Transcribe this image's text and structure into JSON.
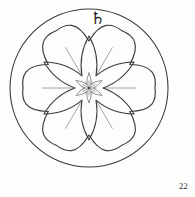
{
  "plate": {
    "planet_glyph": "♄",
    "planet_glyph_name": "saturn-glyph",
    "plate_number": "22",
    "ink_color": "#3a3a3c",
    "background_color": "#fdfdfc"
  },
  "figure": {
    "outer_circle": {
      "center_x": 89,
      "center_y": 88,
      "radius": 79
    },
    "rosette": {
      "lobes": 6,
      "outer_radius": 66,
      "inner_radius": 47,
      "rotation_deg": 0
    },
    "major_star": {
      "points": 6,
      "outer_radius": 52,
      "inner_radius": 14,
      "rotation_deg": -90,
      "concavity": 0.55
    },
    "minor_star": {
      "points": 6,
      "outer_radius": 15,
      "inner_radius": 4,
      "rotation_deg": -90,
      "concavity": 0.5
    },
    "center_burst": {
      "rays": 12,
      "radius": 7
    }
  }
}
